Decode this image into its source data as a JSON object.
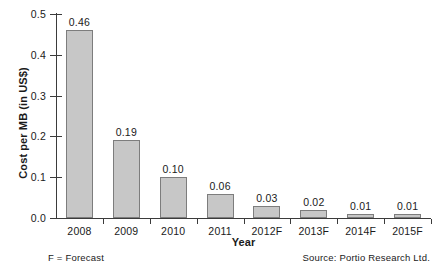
{
  "chart_data": {
    "type": "bar",
    "title": "",
    "categories": [
      "2008",
      "2009",
      "2010",
      "2011",
      "2012F",
      "2013F",
      "2014F",
      "2015F"
    ],
    "values": [
      0.46,
      0.19,
      0.1,
      0.06,
      0.03,
      0.02,
      0.01,
      0.01
    ],
    "value_labels": [
      "0.46",
      "0.19",
      "0.10",
      "0.06",
      "0.03",
      "0.02",
      "0.01",
      "0.01"
    ],
    "xlabel": "Year",
    "ylabel": "Cost per MB (in US$)",
    "ylim": [
      0.0,
      0.5
    ],
    "yticks": [
      0.0,
      0.1,
      0.2,
      0.3,
      0.4,
      0.5
    ],
    "ytick_labels": [
      "0.0",
      "0.1",
      "0.2",
      "0.3",
      "0.4",
      "0.5"
    ],
    "grid": false,
    "legend": null,
    "bar_color": "#c7c7c7",
    "bar_border_color": "#7d7d7d",
    "axis_color": "#3b3b3b"
  },
  "annotations": {
    "forecast_note": "F = Forecast",
    "source_note": "Source: Portio Research Ltd."
  }
}
